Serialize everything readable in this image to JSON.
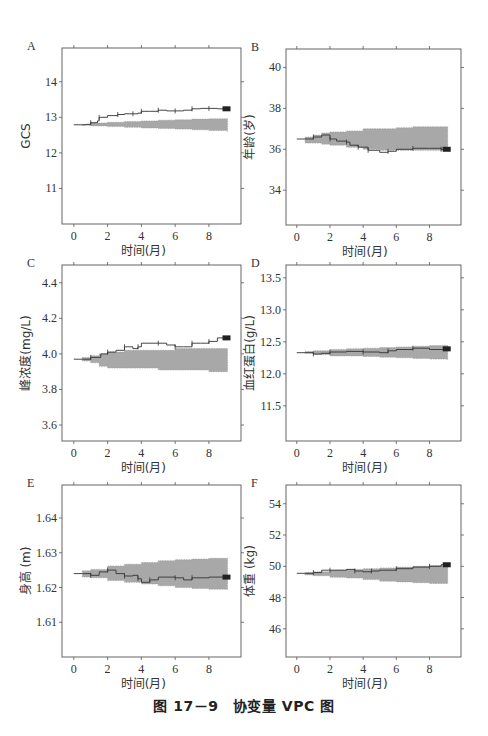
{
  "caption": "图 17－9　协变量 VPC 图",
  "style": {
    "band_color": "#a8a8a8",
    "line_color": "#333333",
    "axis_color": "#555555"
  },
  "chart_data": [
    {
      "panel": "A",
      "type": "area",
      "title": "",
      "xlabel": "时间(月)",
      "ylabel": "GCS",
      "xlim": [
        -0.7,
        9.9
      ],
      "ylim": [
        10.0,
        14.95
      ],
      "xticks": [
        0,
        2,
        4,
        6,
        8
      ],
      "yticks": [
        11,
        12,
        13,
        14
      ],
      "ytick_labels": [
        "11",
        "12",
        "13",
        "14"
      ],
      "box": {
        "x0": 62,
        "x1": 241,
        "y0": 48,
        "y1": 224
      },
      "band": {
        "x": [
          0.5,
          1,
          2,
          3,
          4,
          5,
          6,
          7,
          8,
          9.1
        ],
        "lower": [
          12.78,
          12.76,
          12.74,
          12.72,
          12.7,
          12.69,
          12.67,
          12.65,
          12.63,
          12.6
        ],
        "upper": [
          12.8,
          12.84,
          12.86,
          12.88,
          12.9,
          12.92,
          12.93,
          12.95,
          12.96,
          12.96
        ]
      },
      "observed": {
        "x": [
          0,
          0.7,
          1.0,
          1.4,
          1.5,
          2.0,
          2.6,
          3.0,
          3.5,
          3.8,
          4.0,
          4.5,
          5.0,
          5.5,
          6.0,
          6.5,
          7.0,
          7.5,
          8.0,
          8.5,
          9.1
        ],
        "y": [
          12.79,
          12.8,
          12.85,
          12.9,
          13.0,
          13.05,
          13.08,
          13.1,
          13.1,
          13.12,
          13.17,
          13.17,
          13.2,
          13.18,
          13.18,
          13.2,
          13.24,
          13.25,
          13.25,
          13.24,
          13.24
        ]
      }
    },
    {
      "panel": "B",
      "type": "area",
      "title": "",
      "xlabel": "时间(月)",
      "ylabel": "年龄(岁)",
      "xlim": [
        -0.65,
        9.9
      ],
      "ylim": [
        32.3,
        40.9
      ],
      "xticks": [
        0,
        2,
        4,
        6,
        8
      ],
      "yticks": [
        34,
        36,
        38,
        40
      ],
      "ytick_labels": [
        "34",
        "36",
        "38",
        "40"
      ],
      "box": {
        "x0": 286,
        "x1": 461,
        "y0": 49,
        "y1": 225
      },
      "band": {
        "x": [
          0.5,
          1,
          1.5,
          2,
          3,
          4,
          5,
          6,
          7,
          8,
          9.1
        ],
        "lower": [
          36.3,
          36.3,
          36.25,
          36.2,
          36.1,
          36.0,
          35.95,
          35.95,
          35.95,
          35.95,
          35.95
        ],
        "upper": [
          36.6,
          36.7,
          36.8,
          36.85,
          36.9,
          37.0,
          37.0,
          37.05,
          37.1,
          37.1,
          37.1
        ]
      },
      "observed": {
        "x": [
          0,
          0.7,
          1.0,
          1.5,
          2.0,
          2.4,
          3.0,
          3.2,
          3.7,
          4.0,
          4.3,
          5.0,
          5.5,
          6.0,
          7.0,
          8.0,
          8.7,
          9.1
        ],
        "y": [
          36.5,
          36.5,
          36.6,
          36.7,
          36.5,
          36.4,
          36.35,
          36.2,
          36.1,
          36.1,
          35.95,
          35.85,
          35.9,
          36.0,
          36.05,
          36.05,
          36.0,
          36.0
        ]
      }
    },
    {
      "panel": "C",
      "type": "area",
      "title": "",
      "xlabel": "时间(月)",
      "ylabel": "峰浓度(mg/L)",
      "xlim": [
        -0.7,
        9.9
      ],
      "ylim": [
        3.51,
        4.5
      ],
      "xticks": [
        0,
        2,
        4,
        6,
        8
      ],
      "yticks": [
        3.6,
        3.8,
        4.0,
        4.2,
        4.4
      ],
      "ytick_labels": [
        "3.6",
        "3.8",
        "4.0",
        "4.2",
        "4.4"
      ],
      "box": {
        "x0": 62,
        "x1": 241,
        "y0": 265,
        "y1": 441
      },
      "band": {
        "x": [
          0.5,
          1,
          1.5,
          2,
          3,
          4,
          5,
          6,
          7,
          8,
          9.1
        ],
        "lower": [
          3.96,
          3.95,
          3.93,
          3.92,
          3.92,
          3.92,
          3.91,
          3.91,
          3.91,
          3.9,
          3.9
        ],
        "upper": [
          3.98,
          3.99,
          4.0,
          4.01,
          4.02,
          4.02,
          4.02,
          4.03,
          4.03,
          4.03,
          4.03
        ]
      },
      "observed": {
        "x": [
          0,
          0.6,
          1.0,
          1.6,
          2.0,
          2.5,
          3.0,
          3.5,
          3.8,
          4.0,
          5.0,
          5.5,
          6.0,
          6.5,
          7.0,
          7.5,
          8.0,
          8.5,
          9.1
        ],
        "y": [
          3.97,
          3.97,
          3.98,
          4.0,
          4.01,
          4.02,
          4.04,
          4.03,
          4.04,
          4.06,
          4.06,
          4.05,
          4.04,
          4.04,
          4.06,
          4.06,
          4.07,
          4.09,
          4.09
        ]
      }
    },
    {
      "panel": "D",
      "type": "area",
      "title": "",
      "xlabel": "时间(月)",
      "ylabel": "血红蛋白(g/L)",
      "xlim": [
        -0.65,
        9.9
      ],
      "ylim": [
        10.95,
        13.7
      ],
      "xticks": [
        0,
        2,
        4,
        6,
        8
      ],
      "yticks": [
        11.5,
        12.0,
        12.5,
        13.0,
        13.5
      ],
      "ytick_labels": [
        "11.5",
        "12.0",
        "12.5",
        "13.0",
        "13.5"
      ],
      "box": {
        "x0": 286,
        "x1": 461,
        "y0": 265,
        "y1": 441
      },
      "band": {
        "x": [
          0.5,
          1,
          2,
          3,
          4,
          5,
          6,
          7,
          8,
          9.1
        ],
        "lower": [
          12.32,
          12.3,
          12.28,
          12.28,
          12.27,
          12.26,
          12.25,
          12.24,
          12.23,
          12.22
        ],
        "upper": [
          12.35,
          12.36,
          12.38,
          12.39,
          12.4,
          12.41,
          12.42,
          12.43,
          12.44,
          12.45
        ]
      },
      "observed": {
        "x": [
          0,
          0.5,
          1.0,
          1.5,
          2.0,
          3.0,
          4.0,
          5.0,
          5.5,
          6.0,
          7.0,
          8.0,
          9.1
        ],
        "y": [
          12.33,
          12.33,
          12.31,
          12.32,
          12.34,
          12.35,
          12.34,
          12.33,
          12.36,
          12.38,
          12.4,
          12.38,
          12.39
        ]
      }
    },
    {
      "panel": "E",
      "type": "area",
      "title": "",
      "xlabel": "时间(月)",
      "ylabel": "身高 (m)",
      "xlim": [
        -0.7,
        9.9
      ],
      "ylim": [
        1.6,
        1.6495
      ],
      "xticks": [
        0,
        2,
        4,
        6,
        8
      ],
      "yticks": [
        1.61,
        1.62,
        1.63,
        1.64
      ],
      "ytick_labels": [
        "1.61",
        "1.62",
        "1.63",
        "1.64"
      ],
      "box": {
        "x0": 62,
        "x1": 241,
        "y0": 485,
        "y1": 657
      },
      "band": {
        "x": [
          0.5,
          1,
          2,
          3,
          4,
          5,
          6,
          7,
          8,
          9.1
        ],
        "lower": [
          1.623,
          1.6228,
          1.622,
          1.6215,
          1.621,
          1.6205,
          1.62,
          1.6197,
          1.6195,
          1.6193
        ],
        "upper": [
          1.6248,
          1.6252,
          1.6262,
          1.6267,
          1.6272,
          1.6277,
          1.628,
          1.6282,
          1.6284,
          1.6285
        ]
      },
      "observed": {
        "x": [
          0,
          0.5,
          1.0,
          1.5,
          2.0,
          2.5,
          3.0,
          3.5,
          3.8,
          4.0,
          4.5,
          5.0,
          6.0,
          6.5,
          7.0,
          8.0,
          9.1
        ],
        "y": [
          1.624,
          1.624,
          1.6235,
          1.6245,
          1.625,
          1.624,
          1.6233,
          1.6235,
          1.6225,
          1.6215,
          1.6222,
          1.623,
          1.6228,
          1.6222,
          1.6228,
          1.623,
          1.623
        ]
      }
    },
    {
      "panel": "F",
      "type": "area",
      "title": "",
      "xlabel": "时间(月)",
      "ylabel": "体重 (kg)",
      "xlim": [
        -0.65,
        9.9
      ],
      "ylim": [
        44.2,
        55.2
      ],
      "xticks": [
        0,
        2,
        4,
        6,
        8
      ],
      "yticks": [
        46,
        48,
        50,
        52,
        54
      ],
      "ytick_labels": [
        "46",
        "48",
        "50",
        "52",
        "54"
      ],
      "box": {
        "x0": 286,
        "x1": 461,
        "y0": 485,
        "y1": 657
      },
      "band": {
        "x": [
          0.5,
          1,
          2,
          3,
          4,
          5,
          6,
          7,
          8,
          9.1
        ],
        "lower": [
          49.45,
          49.4,
          49.3,
          49.25,
          49.15,
          49.05,
          49.0,
          48.95,
          48.9,
          48.9
        ],
        "upper": [
          49.6,
          49.65,
          49.75,
          49.8,
          49.85,
          49.9,
          49.95,
          50.0,
          50.05,
          50.1
        ]
      },
      "observed": {
        "x": [
          0,
          0.5,
          1.0,
          1.5,
          2.0,
          3.0,
          3.5,
          4.0,
          4.5,
          5.0,
          6.0,
          7.0,
          8.0,
          8.7,
          9.1
        ],
        "y": [
          49.55,
          49.55,
          49.6,
          49.75,
          49.75,
          49.8,
          49.7,
          49.65,
          49.7,
          49.75,
          49.85,
          49.95,
          50.0,
          50.1,
          50.1
        ]
      }
    }
  ]
}
